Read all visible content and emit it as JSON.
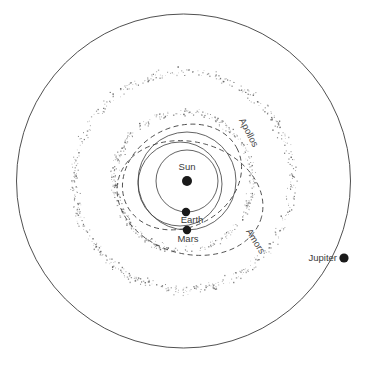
{
  "figure": {
    "type": "solar-system-orbit-diagram",
    "background_color": "#ffffff",
    "line_color": "#3c3c3c",
    "label_color": "#3a3a3a",
    "width": 369,
    "height": 365
  },
  "center": {
    "x": 183.5,
    "y": 181
  },
  "bodies": [
    {
      "name": "sun",
      "label": "Sun",
      "x": 187,
      "y": 181,
      "r": 5.0,
      "label_x": 187,
      "label_y": 170,
      "label_anchor": "middle"
    },
    {
      "name": "earth",
      "label": "Earth",
      "x": 186,
      "y": 212,
      "r": 4.2,
      "label_x": 192,
      "label_y": 223,
      "label_anchor": "middle"
    },
    {
      "name": "mars",
      "label": "Mars",
      "x": 187,
      "y": 230,
      "r": 4.2,
      "label_x": 188,
      "label_y": 242,
      "label_anchor": "middle"
    },
    {
      "name": "jupiter",
      "label": "Jupiter",
      "x": 344,
      "y": 258,
      "r": 4.6,
      "label_x": 337,
      "label_y": 261,
      "label_anchor": "end"
    }
  ],
  "orbits": [
    {
      "name": "jupiter-orbit",
      "style": "solid",
      "cx": 183.5,
      "cy": 181,
      "rx": 167,
      "ry": 167,
      "rotate": 0
    },
    {
      "name": "earth-orbit",
      "style": "solid",
      "cx": 187,
      "cy": 181,
      "rx": 31,
      "ry": 31,
      "rotate": 0
    },
    {
      "name": "mars-orbit",
      "style": "solid",
      "cx": 187,
      "cy": 181,
      "rx": 49,
      "ry": 49,
      "rotate": 0
    },
    {
      "name": "inner-orbit-a",
      "style": "solid",
      "cx": 180,
      "cy": 184,
      "rx": 42,
      "ry": 42,
      "rotate": 0
    },
    {
      "name": "apollos-orbit",
      "style": "dashed",
      "cx": 182,
      "cy": 177,
      "rx": 62,
      "ry": 50,
      "rotate": -28
    },
    {
      "name": "amors-orbit",
      "style": "dashed",
      "cx": 190,
      "cy": 198,
      "rx": 74,
      "ry": 56,
      "rotate": 15
    }
  ],
  "asteroid_belts": [
    {
      "name": "inner-belt",
      "radius": 69,
      "spread": 5.0,
      "count": 420
    },
    {
      "name": "outer-belt",
      "radius": 109,
      "spread": 6.5,
      "count": 560
    }
  ],
  "curve_labels": [
    {
      "name": "apollos-label",
      "text": "Apollos",
      "x": 246,
      "y": 134,
      "rotate": 62
    },
    {
      "name": "amors-label",
      "text": "Amors",
      "x": 253,
      "y": 243,
      "rotate": 58
    }
  ]
}
